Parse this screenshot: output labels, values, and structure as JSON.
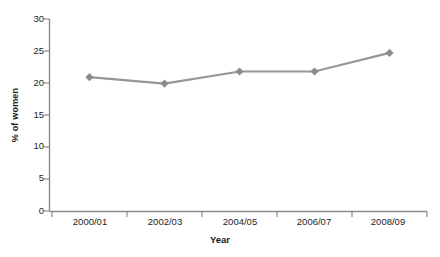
{
  "chart_data": {
    "type": "line",
    "title": "",
    "xlabel": "Year",
    "ylabel": "% of women",
    "categories": [
      "2000/01",
      "2002/03",
      "2004/05",
      "2006/07",
      "2008/09"
    ],
    "values": [
      20.9,
      19.9,
      21.8,
      21.8,
      24.7
    ],
    "ylim": [
      0,
      30
    ],
    "yticks": [
      0,
      5,
      10,
      15,
      20,
      25,
      30
    ],
    "ytick_labels": [
      "0",
      "5",
      "10",
      "15",
      "20",
      "25",
      "30"
    ],
    "grid": false,
    "legend": "none",
    "series": [
      {
        "name": "% of women",
        "values": [
          20.9,
          19.9,
          21.8,
          21.8,
          24.7
        ],
        "color": "#969696",
        "marker": "diamond"
      }
    ]
  },
  "colors": {
    "line": "#969696",
    "marker": "#8c8c8c",
    "axis": "#8a8a8a",
    "text": "#1c1c1c",
    "background": "#ffffff"
  },
  "axis": {
    "y_title": "% of women",
    "x_title": "Year"
  }
}
